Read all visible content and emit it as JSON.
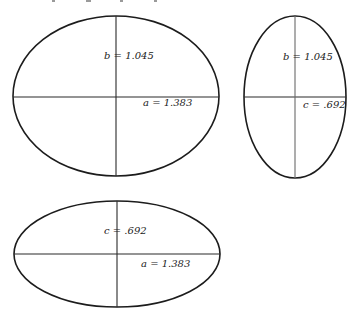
{
  "figure": {
    "colors": {
      "ink": "#1c1c1c",
      "background": "#ffffff"
    },
    "ellipses": [
      {
        "name": "ab-section",
        "cx": 116,
        "cy": 96,
        "rx": 103,
        "ry": 80,
        "labels": {
          "vertical": "b = 1.045",
          "horizontal": "a = 1.383"
        }
      },
      {
        "name": "bc-section",
        "cx": 295,
        "cy": 97,
        "rx": 51,
        "ry": 81,
        "labels": {
          "vertical": "b = 1.045",
          "horizontal": "c = .692"
        }
      },
      {
        "name": "ac-section",
        "cx": 117,
        "cy": 254,
        "rx": 103,
        "ry": 53,
        "labels": {
          "vertical": "c = .692",
          "horizontal": "a = 1.383"
        }
      }
    ]
  }
}
